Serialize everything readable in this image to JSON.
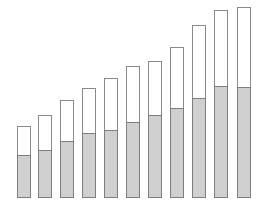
{
  "chart_data": {
    "type": "bar",
    "stacked": true,
    "title": "",
    "xlabel": "",
    "ylabel": "",
    "grid": false,
    "legend": null,
    "categories": [
      "1",
      "2",
      "3",
      "4",
      "5",
      "6",
      "7",
      "8",
      "9",
      "10",
      "11"
    ],
    "series": [
      {
        "name": "lower",
        "color": "#d0d0d0",
        "values": [
          43,
          48,
          57,
          65,
          68,
          76,
          83,
          90,
          100,
          112,
          111
        ]
      },
      {
        "name": "upper",
        "color": "#ffffff",
        "values": [
          29,
          35,
          41,
          45,
          52,
          56,
          54,
          61,
          73,
          76,
          80
        ]
      }
    ],
    "ylim": [
      0,
      195
    ]
  },
  "layout": {
    "baseline_y": 198,
    "bar_width": 14,
    "bar_x": [
      17,
      38,
      60,
      82,
      104,
      126,
      148,
      170,
      192,
      214,
      237
    ]
  }
}
